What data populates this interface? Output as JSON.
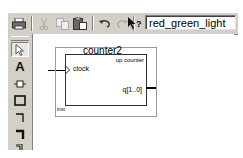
{
  "toolbar": {
    "buttons": [
      {
        "name": "print",
        "icon": "printer-icon",
        "enabled": true
      },
      {
        "name": "cut",
        "icon": "scissors-icon",
        "enabled": false
      },
      {
        "name": "copy",
        "icon": "copy-icon",
        "enabled": false
      },
      {
        "name": "paste",
        "icon": "paste-icon",
        "enabled": true
      },
      {
        "name": "undo",
        "icon": "undo-icon",
        "enabled": true
      },
      {
        "name": "redo",
        "icon": "redo-icon",
        "enabled": false
      },
      {
        "name": "context-help",
        "icon": "help-pointer-icon",
        "enabled": true
      }
    ],
    "entity_field": {
      "value": "red_green_light"
    }
  },
  "palette": {
    "tools": [
      {
        "name": "selection",
        "icon": "arrow-cursor-icon",
        "active": true
      },
      {
        "name": "text",
        "icon": "text-tool-icon",
        "glyph": "A"
      },
      {
        "name": "symbol",
        "icon": "symbol-tool-icon"
      },
      {
        "name": "rectangle",
        "icon": "rectangle-tool-icon"
      },
      {
        "name": "orthogonal-node",
        "icon": "node-tool-icon"
      },
      {
        "name": "orthogonal-bus",
        "icon": "bus-tool-icon"
      },
      {
        "name": "conduit",
        "icon": "conduit-tool-icon"
      }
    ]
  },
  "canvas": {
    "symbol": {
      "title": "counter2",
      "subtitle": "up counter",
      "input_port": "clock",
      "output_port": "q[1..0]",
      "instance": "inst"
    }
  }
}
